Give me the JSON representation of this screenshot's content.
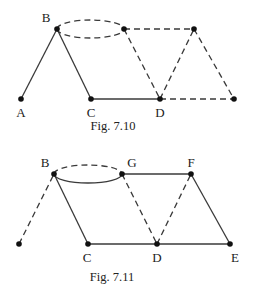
{
  "figures": [
    {
      "id": "fig-7-10",
      "caption": "Fig. 7.10",
      "caption_pos": [
        113,
        130
      ],
      "nodes": [
        {
          "id": "A",
          "label": "A",
          "x": 21,
          "y": 99,
          "lx": 21,
          "ly": 117
        },
        {
          "id": "B",
          "label": "B",
          "x": 57,
          "y": 29,
          "lx": 46,
          "ly": 22
        },
        {
          "id": "C",
          "label": "C",
          "x": 91,
          "y": 99,
          "lx": 91,
          "ly": 117
        },
        {
          "id": "D",
          "label": "D",
          "x": 160,
          "y": 99,
          "lx": 160,
          "ly": 117
        },
        {
          "id": "T1",
          "label": "",
          "x": 124,
          "y": 29
        },
        {
          "id": "T2",
          "label": "",
          "x": 194,
          "y": 29
        },
        {
          "id": "R",
          "label": "",
          "x": 234,
          "y": 99
        }
      ],
      "edges": [
        {
          "from": "A",
          "to": "B",
          "style": "solid"
        },
        {
          "from": "B",
          "to": "C",
          "style": "solid"
        },
        {
          "from": "C",
          "to": "D",
          "style": "solid"
        },
        {
          "from": "T1",
          "to": "T2",
          "style": "dashed"
        },
        {
          "from": "T1",
          "to": "D",
          "style": "dashed"
        },
        {
          "from": "D",
          "to": "T2",
          "style": "dashed"
        },
        {
          "from": "T2",
          "to": "R",
          "style": "dashed"
        },
        {
          "from": "D",
          "to": "R",
          "style": "dashed"
        }
      ],
      "loop": {
        "from": "B",
        "to": "T1",
        "upper_style": "dashed",
        "lower_style": "dashed"
      }
    },
    {
      "id": "fig-7-11",
      "caption": "Fig. 7.11",
      "caption_pos": [
        112,
        281
      ],
      "nodes": [
        {
          "id": "L",
          "label": "",
          "x": 19,
          "y": 244
        },
        {
          "id": "B",
          "label": "B",
          "x": 54,
          "y": 174,
          "lx": 45,
          "ly": 167
        },
        {
          "id": "G",
          "label": "G",
          "x": 122,
          "y": 174,
          "lx": 132,
          "ly": 167
        },
        {
          "id": "F",
          "label": "F",
          "x": 191,
          "y": 174,
          "lx": 191,
          "ly": 167
        },
        {
          "id": "C",
          "label": "C",
          "x": 88,
          "y": 244,
          "lx": 87,
          "ly": 262
        },
        {
          "id": "D",
          "label": "D",
          "x": 157,
          "y": 244,
          "lx": 157,
          "ly": 262
        },
        {
          "id": "E",
          "label": "E",
          "x": 230,
          "y": 244,
          "lx": 235,
          "ly": 262
        }
      ],
      "edges": [
        {
          "from": "L",
          "to": "B",
          "style": "dashed"
        },
        {
          "from": "B",
          "to": "C",
          "style": "solid"
        },
        {
          "from": "C",
          "to": "D",
          "style": "solid"
        },
        {
          "from": "D",
          "to": "E",
          "style": "solid"
        },
        {
          "from": "G",
          "to": "F",
          "style": "solid"
        },
        {
          "from": "F",
          "to": "E",
          "style": "solid"
        },
        {
          "from": "G",
          "to": "D",
          "style": "dashed"
        },
        {
          "from": "D",
          "to": "F",
          "style": "dashed"
        }
      ],
      "loop": {
        "from": "B",
        "to": "G",
        "upper_style": "dashed",
        "lower_style": "solid"
      }
    }
  ]
}
